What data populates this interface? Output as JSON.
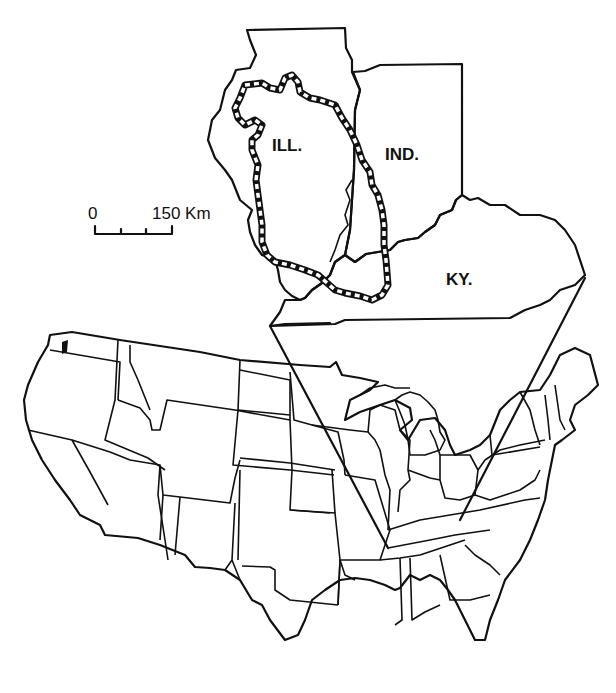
{
  "map": {
    "inset": {
      "labels": {
        "illinois": "ILL.",
        "indiana": "IND.",
        "kentucky": "KY."
      },
      "highlighted_region": "outlined glacial/drainage boundary in Illinois"
    },
    "scale_bar": {
      "start": "0",
      "end": "150 Km",
      "ticks": 4
    },
    "main": {
      "description": "Outline map of the contiguous United States with callout lines to inset"
    },
    "colors": {
      "ink": "#111111",
      "background": "#ffffff"
    }
  }
}
